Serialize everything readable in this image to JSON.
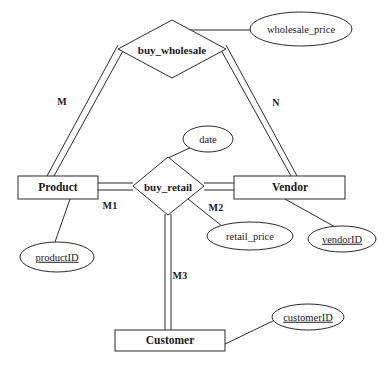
{
  "diagram": {
    "background_color": "#ffffff",
    "line_color": "#2b2b2b",
    "text_color": "#1a1a1a",
    "entities": [
      {
        "id": "product",
        "label": "Product",
        "x": 18,
        "y": 176,
        "w": 80,
        "h": 23
      },
      {
        "id": "vendor",
        "label": "Vendor",
        "x": 234,
        "y": 176,
        "w": 111,
        "h": 23
      },
      {
        "id": "customer",
        "label": "Customer",
        "x": 115,
        "y": 330,
        "w": 110,
        "h": 21
      }
    ],
    "relationships": [
      {
        "id": "buy_wholesale",
        "label": "buy_wholesale",
        "cx": 172,
        "cy": 49,
        "rx": 54,
        "ry": 29
      },
      {
        "id": "buy_retail",
        "label": "buy_retail",
        "cx": 168,
        "cy": 186,
        "rx": 36,
        "ry": 29
      }
    ],
    "attributes": [
      {
        "id": "wholesale_price",
        "label": "wholesale_price",
        "cx": 301,
        "cy": 29,
        "rx": 51,
        "ry": 17,
        "key": false,
        "owner": "buy_wholesale"
      },
      {
        "id": "date",
        "label": "date",
        "cx": 208,
        "cy": 139,
        "rx": 25,
        "ry": 13,
        "key": false,
        "owner": "buy_retail"
      },
      {
        "id": "productID",
        "label": "productID",
        "cx": 57,
        "cy": 257,
        "rx": 37,
        "ry": 15,
        "key": true,
        "owner": "product"
      },
      {
        "id": "retail_price",
        "label": "retail_price",
        "cx": 250,
        "cy": 236,
        "rx": 43,
        "ry": 14,
        "key": false,
        "owner": "buy_retail"
      },
      {
        "id": "vendorID",
        "label": "vendorID",
        "cx": 342,
        "cy": 239,
        "rx": 34,
        "ry": 13,
        "key": true,
        "owner": "vendor"
      },
      {
        "id": "customerID",
        "label": "customerID",
        "cx": 308,
        "cy": 317,
        "rx": 36,
        "ry": 13,
        "key": true,
        "owner": "customer"
      }
    ],
    "cardinalities": [
      {
        "id": "m",
        "label": "M",
        "x": 62,
        "y": 101
      },
      {
        "id": "n",
        "label": "N",
        "x": 276,
        "y": 102
      },
      {
        "id": "m1",
        "label": "M1",
        "x": 110,
        "y": 205
      },
      {
        "id": "m2",
        "label": "M2",
        "x": 216,
        "y": 207
      },
      {
        "id": "m3",
        "label": "M3",
        "x": 180,
        "y": 275
      }
    ],
    "connections": [
      {
        "id": "product-buy_wholesale",
        "from": "product",
        "to": "buy_wholesale",
        "style": "double",
        "cardinality": "M"
      },
      {
        "id": "vendor-buy_wholesale",
        "from": "vendor",
        "to": "buy_wholesale",
        "style": "double",
        "cardinality": "N"
      },
      {
        "id": "buy_wholesale-price",
        "from": "buy_wholesale",
        "to": "wholesale_price",
        "style": "single",
        "cardinality": ""
      },
      {
        "id": "product-buy_retail",
        "from": "product",
        "to": "buy_retail",
        "style": "double",
        "cardinality": "M1"
      },
      {
        "id": "vendor-buy_retail",
        "from": "vendor",
        "to": "buy_retail",
        "style": "double",
        "cardinality": "M2"
      },
      {
        "id": "customer-buy_retail",
        "from": "customer",
        "to": "buy_retail",
        "style": "double",
        "cardinality": "M3"
      },
      {
        "id": "buy_retail-date",
        "from": "buy_retail",
        "to": "date",
        "style": "single",
        "cardinality": ""
      },
      {
        "id": "buy_retail-retail_price",
        "from": "buy_retail",
        "to": "retail_price",
        "style": "single",
        "cardinality": ""
      },
      {
        "id": "product-productID",
        "from": "product",
        "to": "productID",
        "style": "single",
        "cardinality": ""
      },
      {
        "id": "vendor-vendorID",
        "from": "vendor",
        "to": "vendorID",
        "style": "single",
        "cardinality": ""
      },
      {
        "id": "customer-customerID",
        "from": "customer",
        "to": "customerID",
        "style": "single",
        "cardinality": ""
      }
    ]
  }
}
